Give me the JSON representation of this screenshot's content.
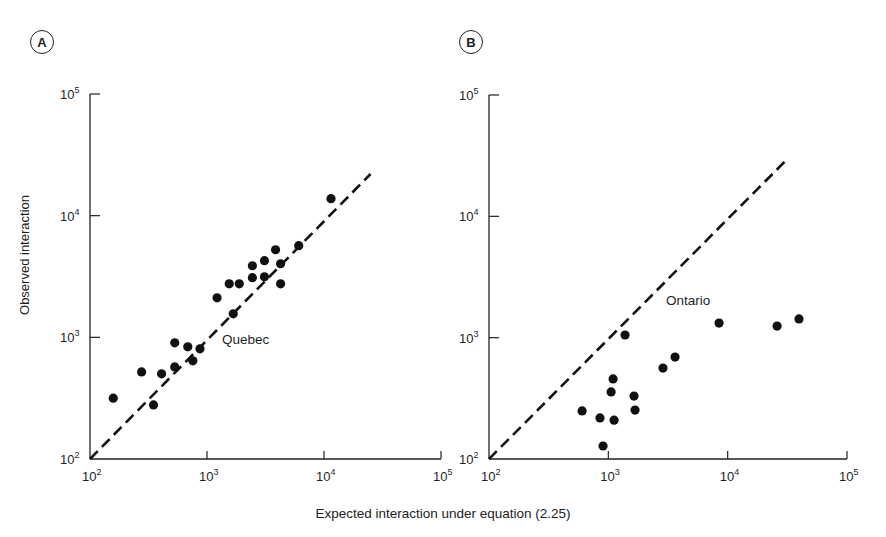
{
  "figure": {
    "y_axis_label": "Observed interaction",
    "x_axis_label": "Expected interaction under equation (2.25)"
  },
  "panels": [
    {
      "badge": "A",
      "region_label": "Quebec",
      "x_ticks": [
        "10",
        "10",
        "10",
        "10"
      ],
      "x_tick_exponents": [
        "2",
        "3",
        "4",
        "5"
      ],
      "y_tick_exponents": [
        "2",
        "3",
        "4",
        "5"
      ]
    },
    {
      "badge": "B",
      "region_label": "Ontario",
      "x_tick_exponents": [
        "2",
        "3",
        "4",
        "5"
      ],
      "y_tick_exponents": [
        "2",
        "3",
        "4",
        "5"
      ]
    }
  ],
  "chart_data": [
    {
      "type": "scatter",
      "title": "A",
      "annotation": "Quebec",
      "xlabel": "Expected interaction under equation (2.25)",
      "ylabel": "Observed interaction",
      "xscale": "log",
      "yscale": "log",
      "xlim": [
        100,
        100000
      ],
      "ylim": [
        100,
        100000
      ],
      "x_tick_labels": [
        "10^2",
        "10^3",
        "10^4",
        "10^5"
      ],
      "y_tick_labels": [
        "10^2",
        "10^3",
        "10^4",
        "10^5"
      ],
      "grid": false,
      "reference_line": {
        "style": "dashed",
        "equation": "y = x",
        "from": [
          100,
          100
        ],
        "to": [
          25000,
          22000
        ]
      },
      "series": [
        {
          "name": "Quebec",
          "points": [
            [
              158,
              316
            ],
            [
              276,
              520
            ],
            [
              349,
              278
            ],
            [
              409,
              501
            ],
            [
              530,
              571
            ],
            [
              530,
              901
            ],
            [
              685,
              836
            ],
            [
              757,
              641
            ],
            [
              871,
              804
            ],
            [
              1219,
              2113
            ],
            [
              1549,
              2755
            ],
            [
              1888,
              2755
            ],
            [
              1676,
              1560
            ],
            [
              2443,
              3090
            ],
            [
              2443,
              3874
            ],
            [
              3097,
              3148
            ],
            [
              3097,
              4266
            ],
            [
              3855,
              5248
            ],
            [
              4256,
              4027
            ],
            [
              4256,
              2755
            ],
            [
              6081,
              5662
            ],
            [
              11482,
              13804
            ]
          ]
        }
      ]
    },
    {
      "type": "scatter",
      "title": "B",
      "annotation": "Ontario",
      "xlabel": "Expected interaction under equation (2.25)",
      "ylabel": "Observed interaction",
      "xscale": "log",
      "yscale": "log",
      "xlim": [
        100,
        100000
      ],
      "ylim": [
        100,
        100000
      ],
      "x_tick_labels": [
        "10^2",
        "10^3",
        "10^4",
        "10^5"
      ],
      "y_tick_labels": [
        "10^2",
        "10^3",
        "10^4",
        "10^5"
      ],
      "grid": false,
      "reference_line": {
        "style": "dashed",
        "equation": "y = x",
        "from": [
          100,
          100
        ],
        "to": [
          32000,
          30000
        ]
      },
      "series": [
        {
          "name": "Ontario",
          "points": [
            [
              603,
              249
            ],
            [
              851,
              218
            ],
            [
              903,
              128
            ],
            [
              1055,
              357
            ],
            [
              1096,
              457
            ],
            [
              1117,
              209
            ],
            [
              1381,
              1052
            ],
            [
              1642,
              330
            ],
            [
              1674,
              253
            ],
            [
              2871,
              562
            ],
            [
              3622,
              692
            ],
            [
              8470,
              1318
            ],
            [
              25950,
              1247
            ],
            [
              39600,
              1426
            ]
          ]
        }
      ]
    }
  ]
}
